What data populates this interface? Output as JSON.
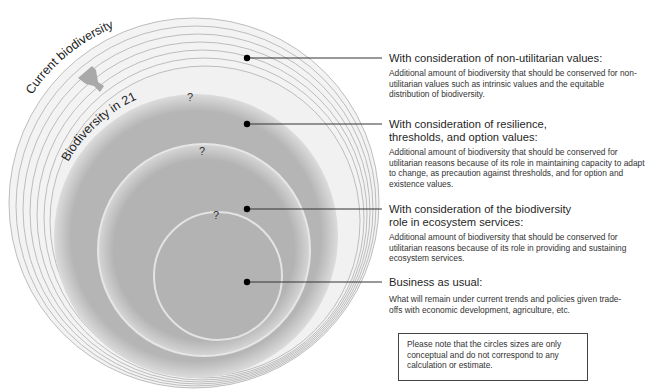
{
  "diagram": {
    "labels": {
      "current": "Current biodiversity",
      "future": "Biodiversity in 2100",
      "q1": "?",
      "q2": "?",
      "q3": "?"
    },
    "colors": {
      "ring_fill": "#f1f1f1",
      "ring_stroke": "#b9b9b9",
      "gray_fill": "#b3b3b3",
      "halo": "#e9e9e9",
      "arrow": "#a9a9a9",
      "dot": "#000000",
      "leader": "#333333"
    }
  },
  "legend": [
    {
      "title": "With consideration of non-utilitarian values:",
      "description": "Additional amount of biodiversity that should be conserved for non-utilitarian values such as intrinsic values and the equitable distribution of biodiversity."
    },
    {
      "title": "With consideration of resilience, thresholds, and option values:",
      "description": "Additional amount of biodiversity that should be conserved for utilitarian reasons because of its role in maintaining capacity to adapt to change, as precaution against thresholds, and for option and existence values."
    },
    {
      "title": "With consideration of the biodiversity role in ecosystem services:",
      "description": "Additional amount of biodiversity that should be conserved for utilitarian reasons because of its role in providing and sustaining ecosystem services."
    },
    {
      "title": "Business as usual:",
      "description": "What will remain under current trends and policies given trade-offs with economic development, agriculture, etc."
    }
  ],
  "note": "Please note that the circles sizes are only conceptual and do not correspond to any calculation or estimate."
}
